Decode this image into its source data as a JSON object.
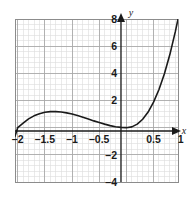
{
  "figure": {
    "name": "cubic-function-graph",
    "background_color": "#ffffff"
  },
  "axes": {
    "x_axis_name": "x",
    "y_axis_name": "y",
    "axis_color": "#1a1a1a",
    "plot_frame_color": "#8c8c8c",
    "grid_minor_color": "#d9d9d9",
    "grid_major_color": "#a6a6a6"
  },
  "labels": {
    "x": [
      {
        "text": "–2",
        "value": -2
      },
      {
        "text": "–1.5",
        "value": -1.5
      },
      {
        "text": "–1",
        "value": -1
      },
      {
        "text": "–0.5",
        "value": -0.5
      },
      {
        "text": "0.5",
        "value": 0.5
      },
      {
        "text": "1",
        "value": 1
      }
    ],
    "y": [
      {
        "text": "8",
        "value": 8
      },
      {
        "text": "6",
        "value": 6
      },
      {
        "text": "4",
        "value": 4
      },
      {
        "text": "2",
        "value": 2
      },
      {
        "text": "–2",
        "value": -2
      },
      {
        "text": "–4",
        "value": -4
      }
    ]
  },
  "chart_data": {
    "type": "line",
    "title": "",
    "xlabel": "x",
    "ylabel": "y",
    "xlim": [
      -2.05,
      0.95
    ],
    "ylim": [
      -4,
      8
    ],
    "x_major_step": 0.5,
    "y_major_step": 2,
    "x_minor_step": 0.1,
    "y_minor_step": 0.4,
    "grid": true,
    "legend": "none",
    "curve_color": "#1a1a1a",
    "curve_width": 1.6,
    "series": [
      {
        "name": "y = 3x²(x + 2)",
        "x": [
          -2.05,
          -2.0,
          -1.9,
          -1.8,
          -1.7,
          -1.6,
          -1.5,
          -1.4,
          -1.3,
          -1.2,
          -1.1,
          -1.0,
          -0.9,
          -0.8,
          -0.7,
          -0.6,
          -0.5,
          -0.4,
          -0.3,
          -0.2,
          -0.1,
          0.0,
          0.1,
          0.2,
          0.3,
          0.4,
          0.5,
          0.6,
          0.7,
          0.8,
          0.9,
          0.95
        ],
        "y": [
          -0.63,
          0.0,
          1.08,
          2.16,
          3.19,
          4.1,
          4.9,
          5.5,
          5.9,
          6.2,
          6.3,
          6.4,
          6.3,
          6.1,
          5.7,
          5.1,
          4.4,
          3.6,
          2.7,
          1.9,
          1.1,
          0.0,
          0.06,
          0.26,
          0.62,
          1.15,
          1.88,
          2.81,
          3.97,
          5.38,
          7.05,
          7.99
        ],
        "y_actual": [
          -0.63,
          0.0,
          0.34,
          0.65,
          0.87,
          1.02,
          1.13,
          1.18,
          1.18,
          1.15,
          1.09,
          1.0,
          0.89,
          0.77,
          0.64,
          0.5,
          0.38,
          0.26,
          0.15,
          0.07,
          0.02,
          0.0,
          0.06,
          0.26,
          0.62,
          1.15,
          1.88,
          2.81,
          3.97,
          5.38,
          7.05,
          7.99
        ]
      }
    ],
    "features": {
      "local_maximum": {
        "x": -1.4,
        "y": 3.0
      },
      "local_minimum": {
        "x": 0.0,
        "y": 0.0
      },
      "x_intercepts": [
        -2.0,
        0.0
      ],
      "y_intercept": 0.0
    }
  }
}
